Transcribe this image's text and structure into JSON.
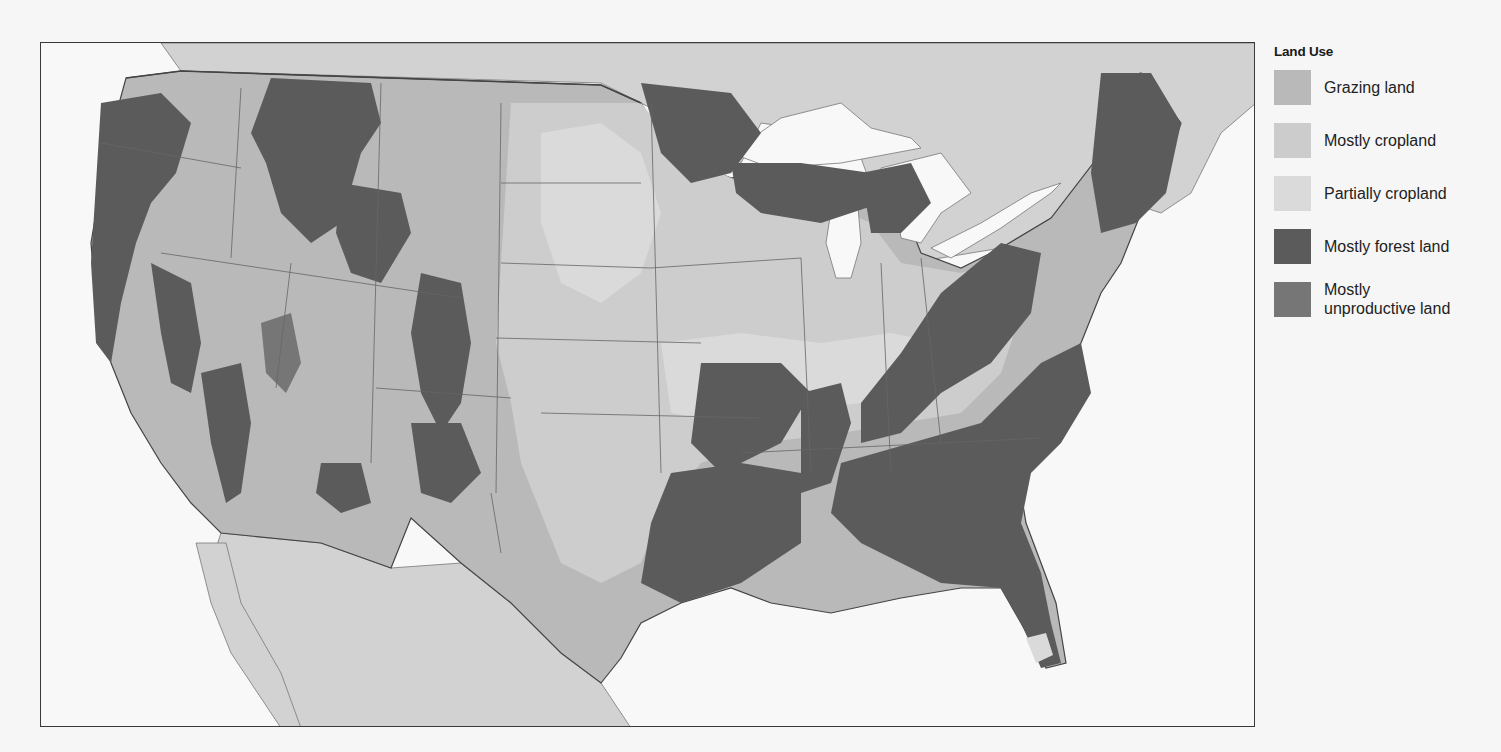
{
  "map": {
    "title": "Land Use",
    "region": "Contiguous United States",
    "colors": {
      "water": "#f7f7f7",
      "foreign_land": "#d2d2d2",
      "border": "#555555",
      "frame": "#3a3a3a"
    }
  },
  "legend": {
    "title": "Land Use",
    "items": [
      {
        "label": "Grazing land",
        "color": "#b9b9b9"
      },
      {
        "label": "Mostly cropland",
        "color": "#cccccc"
      },
      {
        "label": "Partially cropland",
        "color": "#dadada"
      },
      {
        "label": "Mostly forest land",
        "color": "#5b5b5b"
      },
      {
        "label": "Mostly unproductive land",
        "label_line1": "Mostly",
        "label_line2": "unproductive land",
        "color": "#767676"
      }
    ]
  }
}
